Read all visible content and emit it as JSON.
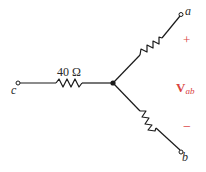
{
  "diagram": {
    "type": "wye-resistor-network",
    "resistor_c": {
      "label": "40 Ω"
    },
    "terminals": {
      "a": "a",
      "b": "b",
      "c": "c"
    },
    "voltage": {
      "symbol": "V",
      "subscript": "ab",
      "plus": "+",
      "minus": "−"
    },
    "colors": {
      "wire": "#1a1a1a",
      "voltage_label": "#d9433f",
      "background": "#ffffff"
    }
  }
}
